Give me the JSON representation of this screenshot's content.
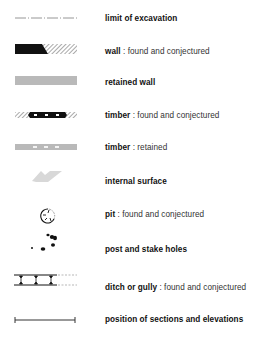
{
  "legend": {
    "items": [
      {
        "id": "limit-of-excavation",
        "title": "limit of excavation",
        "detail": ""
      },
      {
        "id": "wall",
        "title": "wall",
        "detail": " : found and conjectured"
      },
      {
        "id": "retained-wall",
        "title": "retained wall",
        "detail": ""
      },
      {
        "id": "timber",
        "title": "timber",
        "detail": " : found and conjectured"
      },
      {
        "id": "timber-retained",
        "title": "timber",
        "detail": " : retained"
      },
      {
        "id": "internal-surface",
        "title": "internal surface",
        "detail": ""
      },
      {
        "id": "pit",
        "title": "pit",
        "detail": " : found and conjectured"
      },
      {
        "id": "post-and-stake-holes",
        "title": "post and stake holes",
        "detail": ""
      },
      {
        "id": "ditch-or-gully",
        "title": "ditch or gully",
        "detail": " : found and conjectured"
      },
      {
        "id": "position-of-sections",
        "title": "position of sections and elevations",
        "detail": ""
      }
    ]
  },
  "colors": {
    "black": "#111111",
    "grey_fill": "#b9b9b9",
    "grey_light": "#d8d8d8",
    "line_grey": "#8a8a8a"
  }
}
